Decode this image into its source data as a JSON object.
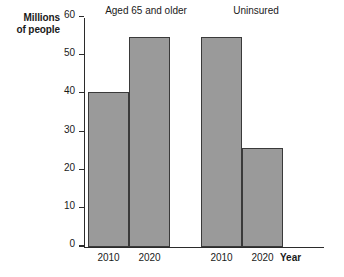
{
  "chart_data": {
    "type": "bar",
    "title": "",
    "xlabel": "Year",
    "ylabel": "Millions of people",
    "ylabel_line1": "Millions",
    "ylabel_line2": "of people",
    "ylim": [
      0,
      60
    ],
    "yticks": [
      0,
      10,
      20,
      30,
      40,
      50,
      60
    ],
    "ytick_labels": [
      "0",
      "10",
      "20",
      "30",
      "40",
      "50",
      "60"
    ],
    "grid": false,
    "legend": "none",
    "categories": [
      "2010",
      "2020",
      "2010",
      "2020"
    ],
    "values": [
      40.3,
      54.8,
      54.8,
      25.8
    ],
    "groups": [
      {
        "label": "Aged 65 and older",
        "bars": [
          {
            "category": "2010",
            "value": 40.3
          },
          {
            "category": "2020",
            "value": 54.8
          }
        ]
      },
      {
        "label": "Uninsured",
        "bars": [
          {
            "category": "2010",
            "value": 54.8
          },
          {
            "category": "2020",
            "value": 25.8
          }
        ]
      }
    ],
    "colors": {
      "bar_fill": "#9a9a9a",
      "bar_stroke": "#3a3a3a",
      "axis": "#2b2b2b",
      "text": "#1a1a1a",
      "background": "#ffffff"
    }
  }
}
